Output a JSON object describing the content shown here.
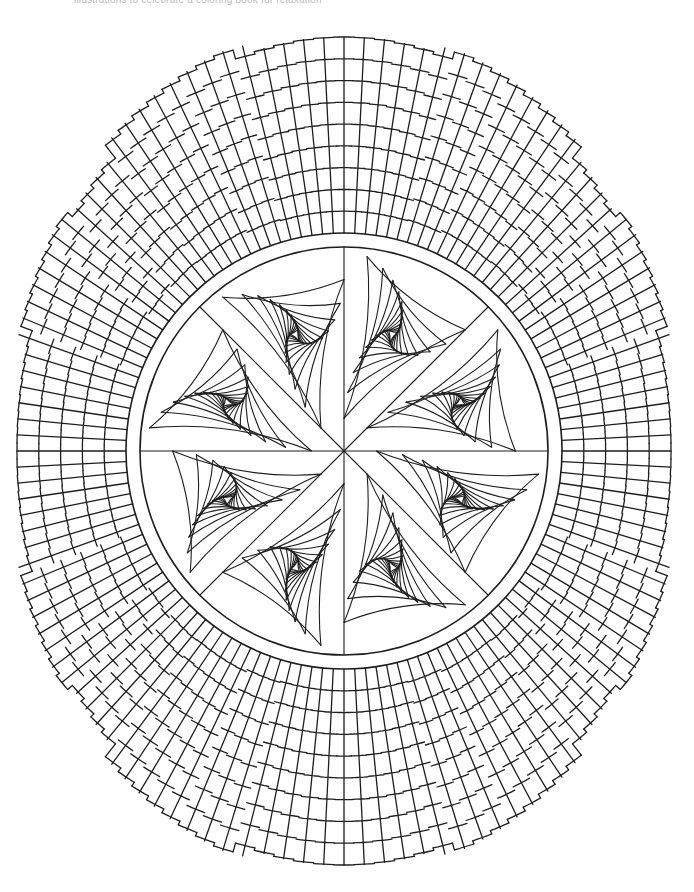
{
  "page": {
    "caption": "illustrations to celebrate a coloring book for relaxation"
  },
  "colors": {
    "background": "#ffffff",
    "line": "#1e1e1e"
  },
  "artwork": {
    "center": [
      344,
      451
    ],
    "inner_band": {
      "outer_radius": 218,
      "inner_radius": 204
    },
    "outer_grid": {
      "spokes": 128,
      "ring_spacing": 22,
      "outer_rx": 327,
      "outer_ry": 414,
      "steps": [
        {
          "from_deg": -128,
          "to_deg": -105,
          "extra": 12
        },
        {
          "from_deg": -75,
          "to_deg": -52,
          "extra": 10
        },
        {
          "from_deg": -160,
          "to_deg": -140,
          "extra": 10
        },
        {
          "from_deg": -40,
          "to_deg": -20,
          "extra": 10
        },
        {
          "from_deg": 20,
          "to_deg": 40,
          "extra": 10
        },
        {
          "from_deg": 140,
          "to_deg": 160,
          "extra": 10
        },
        {
          "from_deg": 52,
          "to_deg": 75,
          "extra": 10
        },
        {
          "from_deg": 105,
          "to_deg": 128,
          "extra": 12
        }
      ]
    },
    "petals": {
      "count": 8,
      "iterations": 11,
      "twist": 0.16
    }
  }
}
